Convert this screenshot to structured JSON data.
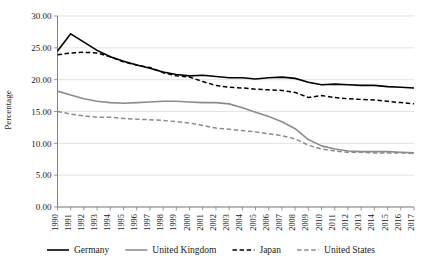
{
  "chart_data": {
    "type": "line",
    "title": "",
    "xlabel": "",
    "ylabel": "Percentage",
    "ylim": [
      0,
      30
    ],
    "ytick_step": 5,
    "ytick_labels": [
      "0.00",
      "5.00",
      "10.00",
      "15.00",
      "20.00",
      "25.00",
      "30.00"
    ],
    "grid": true,
    "legend_position": "bottom",
    "x": [
      1990,
      1991,
      1992,
      1993,
      1994,
      1995,
      1996,
      1997,
      1998,
      1999,
      2000,
      2001,
      2002,
      2003,
      2004,
      2005,
      2006,
      2007,
      2008,
      2009,
      2010,
      2011,
      2012,
      2013,
      2014,
      2015,
      2016,
      2017
    ],
    "categories": [
      "1990",
      "1991",
      "1992",
      "1993",
      "1994",
      "1995",
      "1996",
      "1997",
      "1998",
      "1999",
      "2000",
      "2001",
      "2002",
      "2003",
      "2004",
      "2005",
      "2006",
      "2007",
      "2008",
      "2009",
      "2010",
      "2011",
      "2012",
      "2013",
      "2014",
      "2015",
      "2016",
      "2017"
    ],
    "series": [
      {
        "name": "Germany",
        "color": "#000000",
        "style": "solid",
        "values": [
          24.5,
          27.2,
          25.9,
          24.6,
          23.6,
          22.9,
          22.3,
          21.8,
          21.2,
          20.8,
          20.6,
          20.7,
          20.5,
          20.3,
          20.3,
          20.1,
          20.3,
          20.4,
          20.2,
          19.6,
          19.2,
          19.3,
          19.2,
          19.1,
          19.1,
          18.9,
          18.8,
          18.7
        ]
      },
      {
        "name": "United Kingdom",
        "color": "#8c8c8c",
        "style": "solid",
        "values": [
          18.2,
          17.6,
          17.0,
          16.6,
          16.4,
          16.3,
          16.4,
          16.5,
          16.6,
          16.6,
          16.5,
          16.4,
          16.4,
          16.2,
          15.6,
          14.9,
          14.2,
          13.4,
          12.3,
          10.6,
          9.6,
          9.1,
          8.8,
          8.7,
          8.7,
          8.7,
          8.6,
          8.5
        ]
      },
      {
        "name": "Japan",
        "color": "#000000",
        "style": "dashed",
        "values": [
          23.9,
          24.2,
          24.3,
          24.2,
          23.6,
          22.8,
          22.3,
          21.9,
          21.1,
          20.6,
          20.4,
          19.7,
          19.1,
          18.8,
          18.7,
          18.5,
          18.4,
          18.3,
          18.0,
          17.2,
          17.5,
          17.2,
          17.0,
          16.9,
          16.8,
          16.6,
          16.4,
          16.2
        ]
      },
      {
        "name": "United States",
        "color": "#8c8c8c",
        "style": "dashed",
        "values": [
          15.0,
          14.6,
          14.3,
          14.1,
          14.1,
          13.9,
          13.8,
          13.7,
          13.6,
          13.4,
          13.2,
          12.8,
          12.4,
          12.2,
          12.0,
          11.8,
          11.5,
          11.2,
          10.7,
          9.7,
          9.1,
          8.8,
          8.6,
          8.6,
          8.5,
          8.5,
          8.5,
          8.4
        ]
      }
    ],
    "legend": [
      {
        "label": "Germany",
        "color": "#000000",
        "style": "solid"
      },
      {
        "label": "United Kingdom",
        "color": "#8c8c8c",
        "style": "solid"
      },
      {
        "label": "Japan",
        "color": "#000000",
        "style": "dashed"
      },
      {
        "label": "United States",
        "color": "#8c8c8c",
        "style": "dashed"
      }
    ]
  }
}
